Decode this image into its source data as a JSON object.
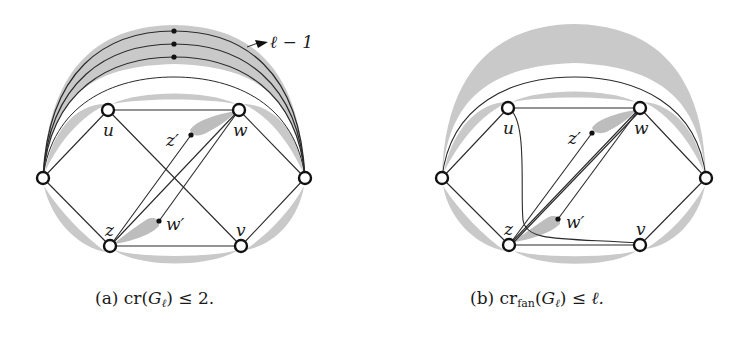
{
  "figure": {
    "panels": [
      {
        "id": "a",
        "caption_prefix": "(a)",
        "caption_func": "cr",
        "caption_sub": "",
        "caption_arg": "G",
        "caption_arg_sub": "ℓ",
        "caption_rel": "≤",
        "caption_rhs": "2.",
        "annotation": "ℓ − 1",
        "vertex_labels": {
          "u": "u",
          "w": "w",
          "z": "z",
          "v": "v",
          "z_prime": "z′",
          "w_prime": "w′"
        }
      },
      {
        "id": "b",
        "caption_prefix": "(b)",
        "caption_func": "cr",
        "caption_sub": "fan",
        "caption_arg": "G",
        "caption_arg_sub": "ℓ",
        "caption_rel": "≤",
        "caption_rhs": "ℓ.",
        "vertex_labels": {
          "u": "u",
          "w": "w",
          "z": "z",
          "v": "v",
          "z_prime": "z′",
          "w_prime": "w′"
        }
      }
    ],
    "colors": {
      "shade": "#c8c8c8",
      "edge": "#2a2a2a",
      "vertex_fill": "#ffffff",
      "vertex_stroke": "#111111"
    }
  }
}
